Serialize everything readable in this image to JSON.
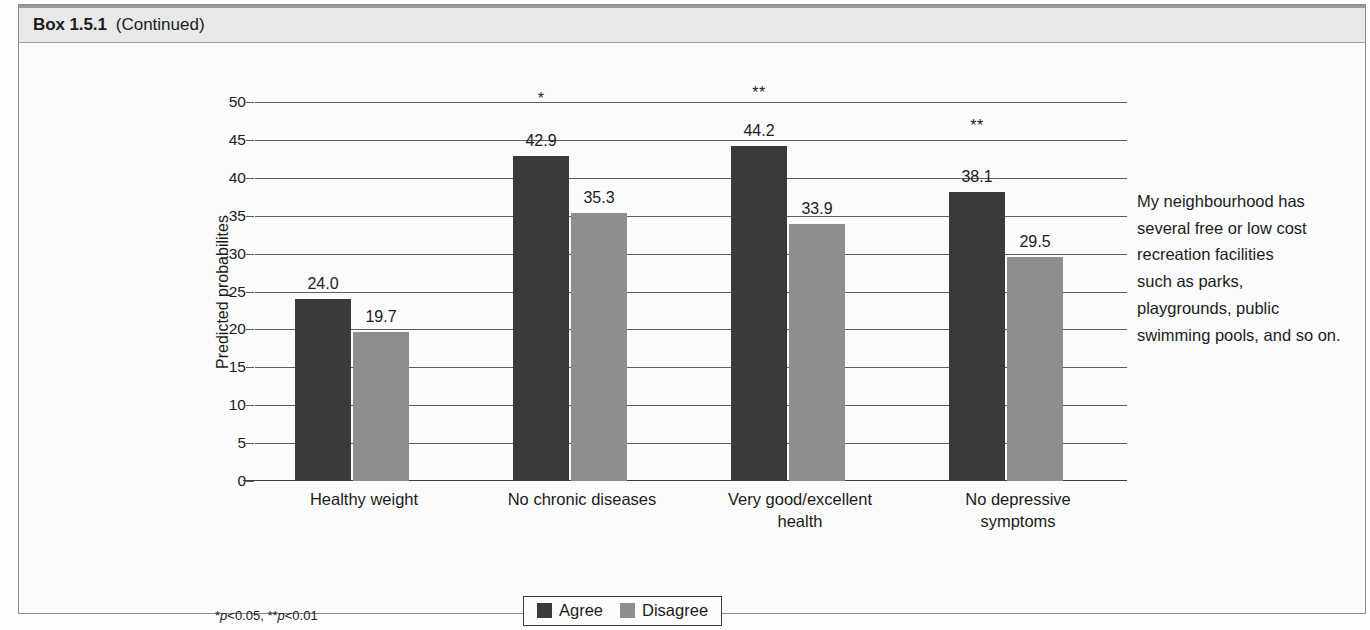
{
  "header": {
    "box_label": "Box 1.5.1",
    "continued_label": "(Continued)"
  },
  "legend": {
    "items": [
      {
        "label": "Agree",
        "color": "#3a3a3a"
      },
      {
        "label": "Disagree",
        "color": "#8e8e8e"
      }
    ]
  },
  "footnote": {
    "text": "*p<0.05, **p<0.01",
    "star1": "*",
    "p1": "p",
    "v1": "<0.05, ",
    "star2": "**",
    "p2": "p",
    "v2": "<0.01"
  },
  "annotation": {
    "text": "My neighbourhood has several free or low cost recreation facilities such as parks, playgrounds, public swimming pools, and so on.",
    "lines": [
      "My neighbourhood has",
      "several free or low cost",
      "recreation facilities",
      "such as parks,",
      "playgrounds, public",
      "swimming pools, and so on."
    ]
  },
  "chart_data": {
    "type": "bar",
    "title": "",
    "xlabel": "",
    "ylabel": "Predicted probabilites",
    "ylim": [
      0,
      50
    ],
    "ytick_step": 5,
    "yticks": [
      "0",
      "5",
      "10",
      "15",
      "20",
      "25",
      "30",
      "35",
      "40",
      "45",
      "50"
    ],
    "grid": true,
    "legend_position": "bottom-center",
    "categories": [
      "Healthy weight",
      "No chronic diseases",
      "Very good/excellent health",
      "No depressive symptoms"
    ],
    "category_lines": [
      [
        "Healthy weight"
      ],
      [
        "No chronic diseases"
      ],
      [
        "Very good/excellent",
        "health"
      ],
      [
        "No depressive",
        "symptoms"
      ]
    ],
    "series": [
      {
        "name": "Agree",
        "color": "#3a3a3a",
        "values": [
          24.0,
          42.9,
          44.2,
          38.1
        ],
        "labels": [
          "24.0",
          "42.9",
          "44.2",
          "38.1"
        ]
      },
      {
        "name": "Disagree",
        "color": "#8e8e8e",
        "values": [
          19.7,
          35.3,
          33.9,
          29.5
        ],
        "labels": [
          "19.7",
          "35.3",
          "33.9",
          "29.5"
        ]
      }
    ],
    "significance": [
      "",
      "*",
      "**",
      "**"
    ],
    "significance_y": [
      0,
      49.2,
      50.0,
      45.6
    ]
  }
}
